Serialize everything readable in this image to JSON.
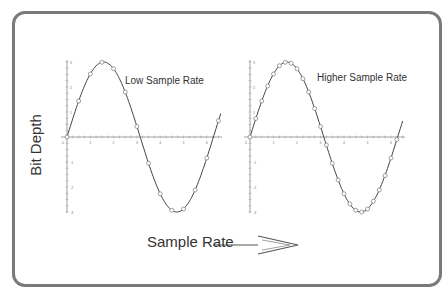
{
  "figure": {
    "y_axis_label": "Bit Depth",
    "x_axis_label": "Sample Rate",
    "arrow": "right-arrow",
    "frame_color": "#7a7a7a",
    "line_color": "#444444"
  },
  "panels": [
    {
      "title": "Low Sample Rate",
      "function": "3*sin(x)",
      "x_range": [
        0,
        6.6
      ],
      "y_range": [
        -3,
        3
      ],
      "sample_step": 0.5,
      "x_ticks": [
        "0",
        "1",
        "2",
        "3",
        "4",
        "5",
        "6"
      ],
      "y_ticks": [
        "3",
        "2",
        "1",
        "-1",
        "-2",
        "-3"
      ]
    },
    {
      "title": "Higher Sample Rate",
      "function": "3*sin(x)",
      "x_range": [
        0,
        6.5
      ],
      "y_range": [
        -3,
        3
      ],
      "sample_step": 0.25,
      "x_ticks": [
        "0",
        "1",
        "2",
        "3",
        "4",
        "5",
        "6"
      ],
      "y_ticks": [
        "3",
        "2",
        "1",
        "-1",
        "-2",
        "-3"
      ]
    }
  ],
  "chart_data": [
    {
      "type": "line",
      "title": "Low Sample Rate",
      "xlabel": "Sample Rate",
      "ylabel": "Bit Depth",
      "series": [
        {
          "name": "3 sin(x)",
          "x": [
            0,
            0.5,
            1,
            1.5,
            2,
            2.5,
            3,
            3.5,
            4,
            4.5,
            5,
            5.5,
            6,
            6.5
          ],
          "values": [
            0,
            1.44,
            2.52,
            2.99,
            2.73,
            1.8,
            0.42,
            -1.05,
            -2.27,
            -2.93,
            -2.88,
            -2.12,
            -0.84,
            0.65
          ]
        }
      ],
      "xlim": [
        0,
        6.6
      ],
      "ylim": [
        -3,
        3
      ],
      "grid": false
    },
    {
      "type": "line",
      "title": "Higher Sample Rate",
      "xlabel": "Sample Rate",
      "ylabel": "Bit Depth",
      "series": [
        {
          "name": "3 sin(x)",
          "x": [
            0,
            0.25,
            0.5,
            0.75,
            1,
            1.25,
            1.5,
            1.75,
            2,
            2.25,
            2.5,
            2.75,
            3,
            3.25,
            3.5,
            3.75,
            4,
            4.25,
            4.5,
            4.75,
            5,
            5.25,
            5.5,
            5.75,
            6,
            6.25
          ],
          "values": [
            0,
            0.74,
            1.44,
            2.04,
            2.52,
            2.85,
            2.99,
            2.95,
            2.73,
            2.33,
            1.8,
            1.14,
            0.42,
            -0.32,
            -1.05,
            -1.72,
            -2.27,
            -2.68,
            -2.93,
            -3.0,
            -2.88,
            -2.57,
            -2.12,
            -1.54,
            -0.84,
            -0.1
          ]
        }
      ],
      "xlim": [
        0,
        6.5
      ],
      "ylim": [
        -3,
        3
      ],
      "grid": false
    }
  ]
}
